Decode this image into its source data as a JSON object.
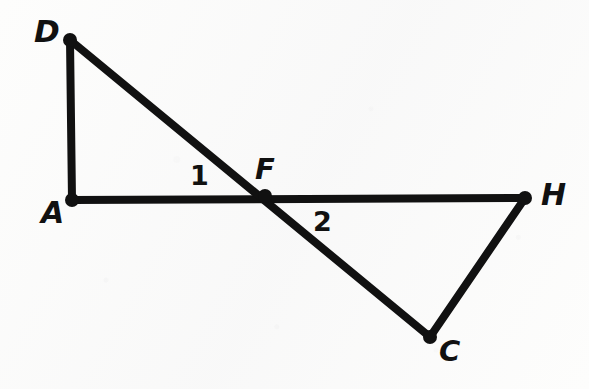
{
  "figure": {
    "kind": "hand-drawn-geometry-diagram",
    "ink_color": "#111111",
    "background_color": "#fdfdfc",
    "canvas": {
      "width": 589,
      "height": 389
    },
    "stroke_width": 8,
    "node_radius": 7
  },
  "points": [
    {
      "id": "D",
      "label": "D",
      "x": 70,
      "y": 40,
      "label_x": 34,
      "label_y": 16,
      "font_size": 31
    },
    {
      "id": "A",
      "label": "A",
      "x": 72,
      "y": 200,
      "label_x": 41,
      "label_y": 198,
      "font_size": 30
    },
    {
      "id": "F",
      "label": "F",
      "x": 265,
      "y": 196,
      "label_x": 255,
      "label_y": 155,
      "font_size": 29
    },
    {
      "id": "H",
      "label": "H",
      "x": 525,
      "y": 198,
      "label_x": 541,
      "label_y": 180,
      "font_size": 30
    },
    {
      "id": "C",
      "label": "C",
      "x": 430,
      "y": 337,
      "label_x": 439,
      "label_y": 337,
      "font_size": 29
    }
  ],
  "segments": [
    {
      "id": "DA",
      "from": "D",
      "to": "A",
      "x1": 70,
      "y1": 40,
      "x2": 72,
      "y2": 200
    },
    {
      "id": "AH",
      "from": "A",
      "to": "H",
      "x1": 72,
      "y1": 200,
      "x2": 525,
      "y2": 198
    },
    {
      "id": "DC",
      "from": "D",
      "to": "C",
      "x1": 70,
      "y1": 40,
      "x2": 430,
      "y2": 337
    },
    {
      "id": "HC",
      "from": "H",
      "to": "C",
      "x1": 525,
      "y1": 198,
      "x2": 430,
      "y2": 337
    }
  ],
  "angle_labels": [
    {
      "id": "angle-1",
      "label": "1",
      "x": 190,
      "y": 162,
      "font_size": 27
    },
    {
      "id": "angle-2",
      "label": "2",
      "x": 313,
      "y": 208,
      "font_size": 27
    }
  ]
}
